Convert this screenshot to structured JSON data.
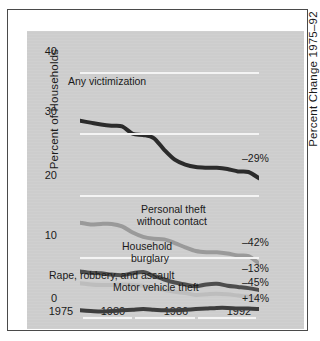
{
  "chart_data": {
    "type": "line",
    "title": "",
    "xlabel": "",
    "ylabel": "Percent of Households",
    "right_axis_label": "Percent Change 1975–92",
    "xlim": [
      1975,
      1992
    ],
    "ylim": [
      0,
      40
    ],
    "yticks": [
      0,
      10,
      20,
      30,
      40
    ],
    "ytick_labels": [
      "0",
      "10",
      "20",
      "30",
      "40"
    ],
    "xticks": [
      1975,
      1980,
      1986,
      1992
    ],
    "xtick_labels": [
      "1975",
      "1980",
      "1986",
      "1992"
    ],
    "grid": true,
    "grid_color": "#f4f4f4",
    "legend_position": "inline-annotations",
    "plot_background": "#cfcfcf",
    "x": [
      1975,
      1976,
      1977,
      1978,
      1979,
      1980,
      1981,
      1982,
      1983,
      1984,
      1985,
      1986,
      1987,
      1988,
      1989,
      1990,
      1991,
      1992
    ],
    "series": [
      {
        "name": "Any victimization",
        "color": "#2b2b2b",
        "percent_change": "–29%",
        "values": [
          32.1,
          31.8,
          31.5,
          31.3,
          31.2,
          30.0,
          29.8,
          29.3,
          27.4,
          25.8,
          25.0,
          24.6,
          24.5,
          24.5,
          24.3,
          23.9,
          23.8,
          22.8
        ]
      },
      {
        "name": "Personal theft without contact",
        "color": "#9a9a9a",
        "percent_change": "–42%",
        "values": [
          15.6,
          15.3,
          15.4,
          15.4,
          15.0,
          14.0,
          13.3,
          13.0,
          12.9,
          12.3,
          11.6,
          11.0,
          10.8,
          10.8,
          10.6,
          10.3,
          10.2,
          9.0
        ]
      },
      {
        "name": "Household burglary",
        "color": "#4e4e4e",
        "percent_change": "–13%",
        "values": [
          7.7,
          7.5,
          7.4,
          7.2,
          7.1,
          7.4,
          7.6,
          7.0,
          6.4,
          5.9,
          5.6,
          5.3,
          5.6,
          5.7,
          5.4,
          5.2,
          5.0,
          4.7
        ]
      },
      {
        "name": "Rape, robbery, and assault",
        "color": "#bdbdbd",
        "percent_change": "–45%",
        "values": [
          5.8,
          5.6,
          5.5,
          5.5,
          5.6,
          5.5,
          5.4,
          5.0,
          4.7,
          4.4,
          4.2,
          3.9,
          4.0,
          4.1,
          4.0,
          3.8,
          3.6,
          3.4
        ]
      },
      {
        "name": "Motor vehicle theft",
        "color": "#3d3d3d",
        "percent_change": "+14%",
        "values": [
          1.4,
          1.3,
          1.2,
          1.3,
          1.4,
          1.5,
          1.6,
          1.5,
          1.4,
          1.4,
          1.5,
          1.6,
          1.7,
          1.8,
          1.8,
          1.7,
          1.7,
          1.6
        ]
      }
    ],
    "annotations": [
      {
        "text": "Any victimization",
        "series": "Any victimization"
      },
      {
        "text": "Personal theft",
        "series": "Personal theft without contact"
      },
      {
        "text": "without contact",
        "series": "Personal theft without contact"
      },
      {
        "text": "Household",
        "series": "Household burglary"
      },
      {
        "text": "burglary",
        "series": "Household burglary"
      },
      {
        "text": "Rape, robbery, and assault",
        "series": "Rape, robbery, and assault"
      },
      {
        "text": "Motor vehicle theft",
        "series": "Motor vehicle theft"
      }
    ]
  },
  "labels": {
    "y_axis_title": "Percent of Households",
    "right_axis_title": "Percent Change 1975–92",
    "ytick_40": "40",
    "ytick_30": "30",
    "ytick_20": "20",
    "ytick_10": "10",
    "ytick_0": "0",
    "xtick_1975": "1975",
    "xtick_1980": "1980",
    "xtick_1986": "1986",
    "xtick_1992": "1992",
    "any_victimization": "Any victimization",
    "personal_theft_l1": "Personal theft",
    "personal_theft_l2": "without contact",
    "household_l1": "Household",
    "household_l2": "burglary",
    "rape_robbery_assault": "Rape, robbery, and assault",
    "motor_vehicle_theft": "Motor vehicle theft",
    "change_any": "–29%",
    "change_personal": "–42%",
    "change_burglary": "–13%",
    "change_rra": "–45%",
    "change_mvt": "+14%"
  }
}
